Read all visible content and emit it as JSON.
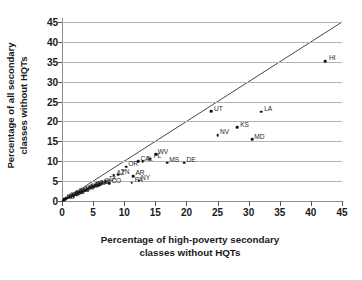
{
  "chart_data": {
    "type": "scatter",
    "title": "",
    "xlabel": "Percentage of high-poverty secondary classes without HQTs",
    "xlabel_lines": [
      "Percentage of high-poverty secondary",
      "classes without HQTs"
    ],
    "ylabel": "Percentage of all secondary classes without HQTs",
    "ylabel_lines": [
      "Percentage of all secondary",
      "classes without HQTs"
    ],
    "xlim": [
      0,
      45
    ],
    "ylim": [
      0,
      45
    ],
    "xticks": [
      0,
      5,
      10,
      15,
      20,
      25,
      30,
      35,
      40,
      45
    ],
    "yticks": [
      0,
      5,
      10,
      15,
      20,
      25,
      30,
      35,
      40,
      45
    ],
    "grid": "horizontal",
    "legend": "none",
    "reference_line": {
      "type": "identity",
      "from": [
        0,
        0
      ],
      "to": [
        45,
        45
      ],
      "label": "y = x"
    },
    "colors": {
      "point": "#111111",
      "gridline": "#b4b4b4",
      "axis": "#8c8c8c",
      "text": "#1a1a1a"
    },
    "points": [
      {
        "label": "HI",
        "x": 42.3,
        "y": 35.2
      },
      {
        "label": "LA",
        "x": 32.0,
        "y": 22.5
      },
      {
        "label": "UT",
        "x": 24.0,
        "y": 22.6
      },
      {
        "label": "KS",
        "x": 28.2,
        "y": 18.6
      },
      {
        "label": "NV",
        "x": 25.0,
        "y": 16.6
      },
      {
        "label": "MD",
        "x": 30.6,
        "y": 15.5
      },
      {
        "label": "WV",
        "x": 15.1,
        "y": 11.8
      },
      {
        "label": "FL",
        "x": 14.2,
        "y": 10.6
      },
      {
        "label": "IL",
        "x": 13.0,
        "y": 10.0
      },
      {
        "label": "CA",
        "x": 12.2,
        "y": 10.0
      },
      {
        "label": "MS",
        "x": 16.9,
        "y": 9.6
      },
      {
        "label": "DE",
        "x": 19.6,
        "y": 9.6
      },
      {
        "label": "OR",
        "x": 10.3,
        "y": 8.6
      },
      {
        "label": "AR",
        "x": 11.4,
        "y": 6.3
      },
      {
        "label": "TN",
        "x": 9.0,
        "y": 6.6
      },
      {
        "label": "AZ",
        "x": 8.3,
        "y": 6.5
      },
      {
        "label": "NY",
        "x": 12.3,
        "y": 5.1
      },
      {
        "label": "PA",
        "x": 11.2,
        "y": 4.6
      },
      {
        "label": "CO",
        "x": 7.6,
        "y": 4.5
      },
      {
        "label": "TX",
        "x": 7.0,
        "y": 4.8
      },
      {
        "label": "OH",
        "x": 6.4,
        "y": 4.4
      },
      {
        "label": "MI",
        "x": 6.1,
        "y": 4.2
      },
      {
        "label": "NC",
        "x": 5.8,
        "y": 4.0
      },
      {
        "label": "GA",
        "x": 5.5,
        "y": 3.9
      },
      {
        "label": "SC",
        "x": 5.2,
        "y": 3.7
      },
      {
        "label": "WA",
        "x": 5.0,
        "y": 3.6
      },
      {
        "label": "AL",
        "x": 4.7,
        "y": 3.4
      },
      {
        "label": "IN",
        "x": 4.5,
        "y": 3.3
      },
      {
        "label": "MO",
        "x": 4.3,
        "y": 3.1
      },
      {
        "label": "VA",
        "x": 4.1,
        "y": 3.0
      },
      {
        "label": "OK",
        "x": 3.9,
        "y": 2.8
      },
      {
        "label": "KY",
        "x": 3.7,
        "y": 2.7
      },
      {
        "label": "WI",
        "x": 3.5,
        "y": 2.6
      },
      {
        "label": "MN",
        "x": 3.3,
        "y": 2.4
      },
      {
        "label": "IA",
        "x": 3.1,
        "y": 2.3
      },
      {
        "label": "CT",
        "x": 2.9,
        "y": 2.2
      },
      {
        "label": "NJ",
        "x": 2.7,
        "y": 2.0
      },
      {
        "label": "MA",
        "x": 2.5,
        "y": 1.9
      },
      {
        "label": "NM",
        "x": 2.3,
        "y": 1.8
      },
      {
        "label": "ID",
        "x": 2.1,
        "y": 1.6
      },
      {
        "label": "NE",
        "x": 1.9,
        "y": 1.5
      },
      {
        "label": "ME",
        "x": 1.7,
        "y": 1.4
      },
      {
        "label": "MT",
        "x": 1.5,
        "y": 1.2
      },
      {
        "label": "RI",
        "x": 1.3,
        "y": 1.1
      },
      {
        "label": "SD",
        "x": 1.1,
        "y": 1.0
      },
      {
        "label": "ND",
        "x": 0.9,
        "y": 0.8
      },
      {
        "label": "NH",
        "x": 0.7,
        "y": 0.7
      },
      {
        "label": "VT",
        "x": 0.5,
        "y": 0.5
      },
      {
        "label": "WY",
        "x": 0.4,
        "y": 0.4
      },
      {
        "label": "AK",
        "x": 0.3,
        "y": 0.3
      },
      {
        "label": "NB",
        "x": 0.2,
        "y": 0.1
      }
    ],
    "visible_labels": [
      "HI",
      "LA",
      "UT",
      "KS",
      "NV",
      "MD",
      "WV",
      "FL",
      "IL",
      "CA",
      "MS",
      "DE",
      "OR",
      "AR",
      "TN",
      "AZ",
      "NY",
      "PA",
      "CO"
    ]
  }
}
